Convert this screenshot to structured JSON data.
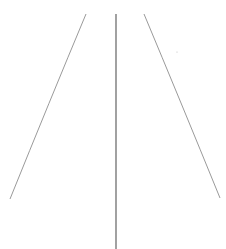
{
  "canvas": {
    "width": 226,
    "height": 249,
    "background": "#ffffff"
  },
  "lines": [
    {
      "name": "left-line",
      "path": "M86,14 Q50,100 10,199",
      "color": "#9a9a9a",
      "width": 1
    },
    {
      "name": "center-line",
      "path": "M116,14 L116,249",
      "color": "#7a7a7a",
      "width": 1.4
    },
    {
      "name": "right-line",
      "path": "M144,14 Q180,100 220,198",
      "color": "#9a9a9a",
      "width": 1
    }
  ],
  "marks": [
    {
      "name": "small-dot",
      "cx": 177,
      "cy": 52,
      "r": 0.6,
      "color": "#bdbdbd"
    }
  ]
}
